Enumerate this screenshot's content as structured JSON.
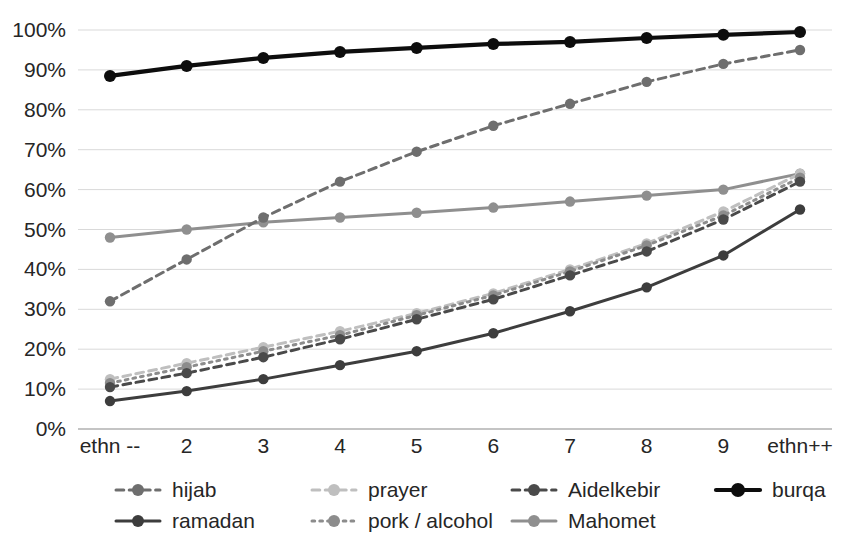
{
  "chart_data": {
    "type": "line",
    "title": "",
    "subtitle": "",
    "xlabel": "",
    "ylabel": "",
    "categories": [
      "ethn --",
      "2",
      "3",
      "4",
      "5",
      "6",
      "7",
      "8",
      "9",
      "ethn++"
    ],
    "x_tick_labels": [
      "ethn --",
      "2",
      "3",
      "4",
      "5",
      "6",
      "7",
      "8",
      "9",
      "ethn++"
    ],
    "y_tick_labels": [
      "0%",
      "10%",
      "20%",
      "30%",
      "40%",
      "50%",
      "60%",
      "70%",
      "80%",
      "90%",
      "100%"
    ],
    "y_tick_values": [
      0,
      10,
      20,
      30,
      40,
      50,
      60,
      70,
      80,
      90,
      100
    ],
    "ylim": [
      0,
      100
    ],
    "y_unit": "%",
    "grid": true,
    "grid_axis": "y",
    "legend_position": "bottom",
    "legend_columns": 4,
    "series": [
      {
        "name": "hijab",
        "color": "#6e6e6e",
        "line_style": "dashed",
        "marker": "circle",
        "values": [
          32,
          42.5,
          53,
          62,
          69.5,
          76,
          81.5,
          87,
          91.5,
          95
        ]
      },
      {
        "name": "prayer",
        "color": "#bfbfbf",
        "line_style": "dashed",
        "marker": "circle",
        "values": [
          12.5,
          16.5,
          20.5,
          24.5,
          29,
          34,
          40,
          46.5,
          54.5,
          64
        ]
      },
      {
        "name": "Aidelkebir",
        "color": "#4a4a4a",
        "line_style": "dashed",
        "marker": "circle",
        "values": [
          10.5,
          14,
          18,
          22.5,
          27.5,
          32.5,
          38.5,
          44.5,
          52.5,
          62
        ]
      },
      {
        "name": "burqa",
        "color": "#0d0d0d",
        "line_style": "solid",
        "marker": "circle",
        "values": [
          88.5,
          91,
          93,
          94.5,
          95.5,
          96.5,
          97,
          98,
          98.8,
          99.5
        ]
      },
      {
        "name": "ramadan",
        "color": "#3d3d3d",
        "line_style": "solid",
        "marker": "circle",
        "values": [
          7,
          9.5,
          12.5,
          16,
          19.5,
          24,
          29.5,
          35.5,
          43.5,
          55
        ]
      },
      {
        "name": "pork / alcohol",
        "color": "#8c8c8c",
        "line_style": "dotted",
        "marker": "circle",
        "values": [
          11.5,
          15.5,
          19.5,
          23.5,
          28.5,
          33.5,
          39.5,
          46,
          53.5,
          63
        ]
      },
      {
        "name": "Mahomet",
        "color": "#8f8f8f",
        "line_style": "solid",
        "marker": "circle",
        "values": [
          48,
          50,
          51.8,
          53,
          54.2,
          55.5,
          57,
          58.5,
          60,
          64
        ]
      }
    ]
  },
  "legend": {
    "entries": [
      {
        "label": "hijab"
      },
      {
        "label": "prayer"
      },
      {
        "label": "Aidelkebir"
      },
      {
        "label": "burqa"
      },
      {
        "label": "ramadan"
      },
      {
        "label": "pork / alcohol"
      },
      {
        "label": "Mahomet"
      }
    ]
  },
  "colors": {
    "background": "#ffffff",
    "gridline": "#d9d9d9",
    "axis": "#b0b0b0",
    "text": "#262626"
  }
}
